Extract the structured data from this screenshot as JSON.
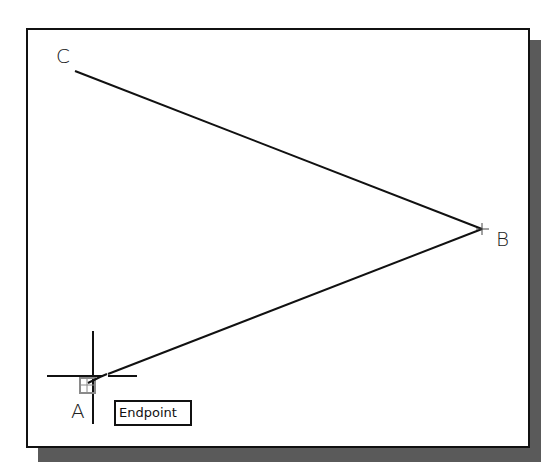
{
  "diagram": {
    "type": "cad-line-drawing",
    "points": [
      {
        "label": "C",
        "x": 75,
        "y": 71,
        "label_x": 56,
        "label_y": 46
      },
      {
        "label": "B",
        "x": 482,
        "y": 229,
        "label_x": 496,
        "label_y": 229
      },
      {
        "label": "A",
        "x": 97,
        "y": 377,
        "label_x": 71,
        "label_y": 401
      }
    ],
    "segments": [
      {
        "from": "C",
        "to": "B"
      },
      {
        "from": "B",
        "to": "A"
      }
    ],
    "cursor": {
      "type": "crosshair",
      "x": 93,
      "y": 376,
      "snap_marker": "endpoint"
    },
    "tooltip": {
      "text": "Endpoint"
    },
    "colors": {
      "line": "#111111",
      "frame": "#111111",
      "shadow": "#5a5a5a",
      "snap_marker": "#8a8a8a"
    }
  }
}
